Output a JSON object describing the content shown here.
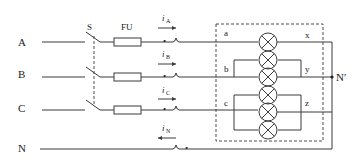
{
  "diagram": {
    "type": "three-phase four-wire circuit with lamp loads",
    "phases": [
      {
        "label": "A",
        "current": "i",
        "current_sub": "A"
      },
      {
        "label": "B",
        "current": "i",
        "current_sub": "B"
      },
      {
        "label": "C",
        "current": "i",
        "current_sub": "C"
      },
      {
        "label": "N",
        "current": "i",
        "current_sub": "N"
      }
    ],
    "switch_label": "S",
    "fuse_label": "FU",
    "load_terminals": {
      "a": "a",
      "b": "b",
      "c": "c",
      "x": "x",
      "y": "y",
      "z": "z"
    },
    "neutral_point_label": "N′",
    "lamps": {
      "phase_a": 1,
      "phase_b": 2,
      "phase_c": 3
    },
    "polarity_mark": "•"
  }
}
